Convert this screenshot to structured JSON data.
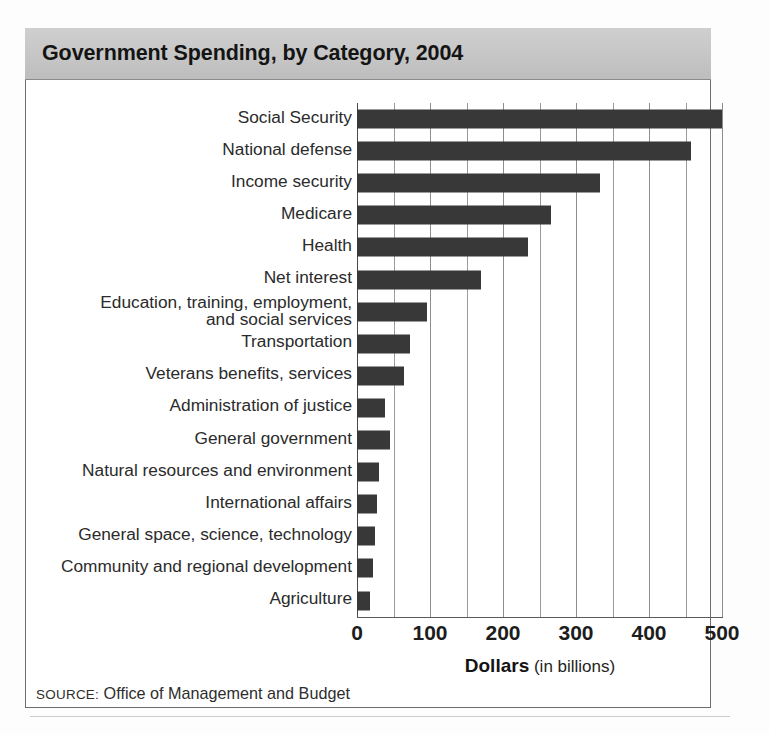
{
  "figure": {
    "title": "Government Spending, by Category, 2004",
    "source_prefix": "SOURCE:",
    "source_text": " Office of Management and Budget",
    "accent_bar_color": "#383838",
    "title_band_color": "#c6c6c6",
    "grid_color": "#9a9a9a"
  },
  "axis": {
    "title_strong": "Dollars",
    "title_light": " (in billions)",
    "tick_labels": [
      "0",
      "100",
      "200",
      "300",
      "400",
      "500"
    ],
    "min": 0,
    "max": 500,
    "major_step": 100,
    "minor_step": 50
  },
  "chart_data": {
    "type": "bar",
    "orientation": "horizontal",
    "title": "Government Spending, by Category, 2004",
    "xlabel": "Dollars (in billions)",
    "ylabel": "",
    "xlim": [
      0,
      500
    ],
    "grid": true,
    "legend": false,
    "units": "billions of dollars",
    "source": "Office of Management and Budget",
    "categories": [
      "Social Security",
      "National defense",
      "Income security",
      "Medicare",
      "Health",
      "Net interest",
      "Education, training, employment,\nand social services",
      "Transportation",
      "Veterans benefits, services",
      "Administration of justice",
      "General government",
      "Natural resources and environment",
      "International affairs",
      "General space, science, technology",
      "Community and regional development",
      "Agriculture"
    ],
    "values": [
      500,
      458,
      333,
      266,
      234,
      170,
      96,
      72,
      65,
      38,
      45,
      30,
      28,
      25,
      22,
      18
    ]
  }
}
